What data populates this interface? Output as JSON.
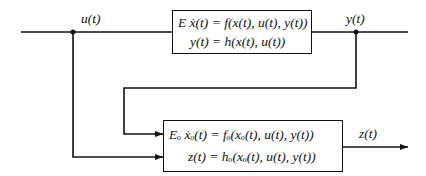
{
  "diagram": {
    "type": "block-diagram",
    "signals": {
      "input": "u(t)",
      "output": "y(t)",
      "observer_output": "z(t)"
    },
    "blocks": [
      {
        "id": "system",
        "equations": [
          "E ẋ(t) = f(x(t), u(t), y(t))",
          "y(t) = h(x(t), u(t))"
        ]
      },
      {
        "id": "observer",
        "equations": [
          "Eₒ ẋₒ(t) = fₒ(xₒ(t), u(t), y(t))",
          "z(t) = hₒ(xₒ(t), u(t), y(t))"
        ]
      }
    ],
    "connections": [
      {
        "from": "input u(t)",
        "to": "system"
      },
      {
        "from": "system",
        "to": "output y(t)"
      },
      {
        "from": "output y(t)",
        "to": "observer",
        "kind": "feedback"
      },
      {
        "from": "input u(t)",
        "to": "observer",
        "kind": "branch"
      },
      {
        "from": "observer",
        "to": "output z(t)"
      }
    ],
    "line_color": "#111111"
  }
}
